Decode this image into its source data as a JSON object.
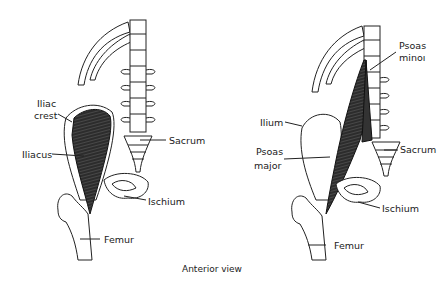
{
  "caption": "Anterior view",
  "left_panel": {
    "labels": {
      "iliac_crest_1": "Iliac",
      "iliac_crest_2": "crest",
      "iliacus": "Iliacus",
      "sacrum": "Sacrum",
      "ischium": "Ischium",
      "femur": "Femur"
    }
  },
  "right_panel": {
    "labels": {
      "psoas_minor_1": "Psoas",
      "psoas_minor_2": "minoı",
      "ilium": "Ilium",
      "psoas_major_1": "Psoas",
      "psoas_major_2": "major",
      "sacrum": "Sacrum",
      "ischium": "Ischium",
      "femur": "Femur"
    }
  },
  "colors": {
    "muscle": "#2a2a2a",
    "bone_stroke": "#222222",
    "background": "#ffffff"
  }
}
